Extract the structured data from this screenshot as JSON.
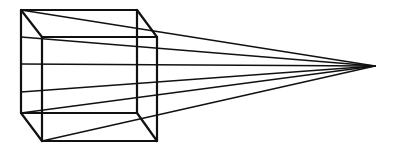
{
  "diagram": {
    "title": "",
    "stroke_color": "#111111",
    "background": "#ffffff",
    "cube": {
      "back_face": {
        "tl": [
          21,
          10
        ],
        "tr": [
          137,
          10
        ],
        "br": [
          137,
          113
        ],
        "bl": [
          21,
          113
        ]
      },
      "front_face": {
        "tl": [
          42,
          37
        ],
        "tr": [
          157,
          37
        ],
        "br": [
          157,
          141
        ],
        "bl": [
          42,
          141
        ]
      }
    },
    "vanishing_point": [
      375,
      66
    ],
    "rays_from": [
      [
        21,
        10
      ],
      [
        21,
        37
      ],
      [
        21,
        64
      ],
      [
        21,
        92
      ],
      [
        21,
        113
      ],
      [
        42,
        141
      ]
    ]
  }
}
